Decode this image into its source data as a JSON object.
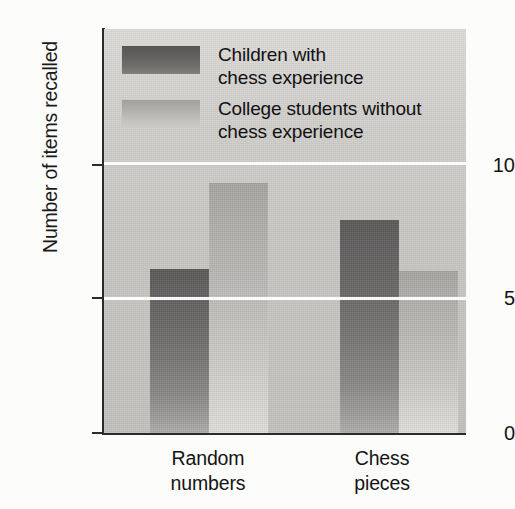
{
  "chart_data": {
    "type": "bar",
    "title": "",
    "subtitle": "",
    "xlabel": "",
    "ylabel": "Number of items recalled",
    "categories": [
      "Random\nnumbers",
      "Chess\npieces"
    ],
    "category_labels_flat": [
      "Random numbers",
      "Chess pieces"
    ],
    "series": [
      {
        "name": "Children with\nchess experience",
        "name_flat": "Children with chess experience",
        "values": [
          6.1,
          7.9
        ],
        "color": "#6b6967"
      },
      {
        "name": "College students without\nchess experience",
        "name_flat": "College students without chess experience",
        "values": [
          9.3,
          6.0
        ],
        "color": "#bab8b5"
      }
    ],
    "ylim": [
      0,
      15
    ],
    "yticks": [
      0,
      5,
      10
    ],
    "ytick_labels": [
      "0",
      "5",
      "10"
    ],
    "gridlines": [
      5,
      10
    ],
    "gridline_color": "#ffffff",
    "grid": true,
    "legend_position": "inside-top-left",
    "plot_background": "#c9c7c4",
    "page_background": "#fcfcfb",
    "axis_color": "#2b2b2b"
  },
  "axes": {
    "y_title": "Number of items recalled",
    "ticks": {
      "t10": "10",
      "t5": "5",
      "t0": "0"
    }
  },
  "legend": {
    "entries": [
      {
        "label": "Children with\nchess experience",
        "swatch": "dark-gray-swatch"
      },
      {
        "label": "College students without\nchess experience",
        "swatch": "light-gray-swatch"
      }
    ]
  },
  "categories": [
    {
      "label": "Random\nnumbers"
    },
    {
      "label": "Chess\npieces"
    }
  ]
}
